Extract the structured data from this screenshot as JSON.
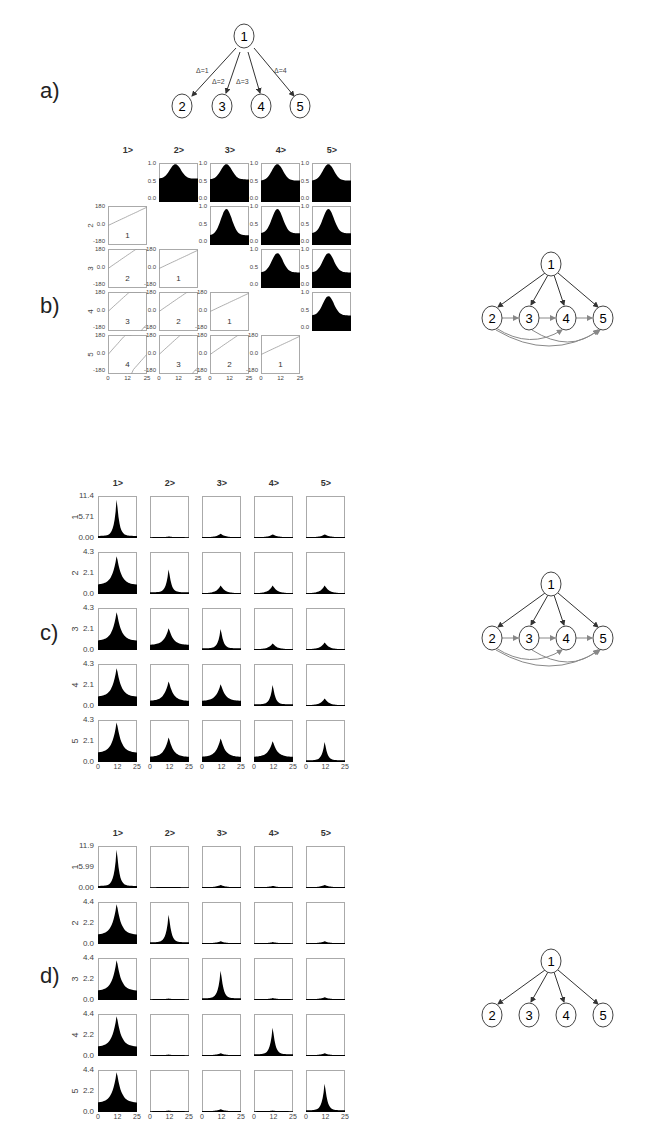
{
  "panels": {
    "a": {
      "letter": "a)"
    },
    "b": {
      "letter": "b)"
    },
    "c": {
      "letter": "c)"
    },
    "d": {
      "letter": "d)"
    }
  },
  "graph_a": {
    "nodes": [
      "1",
      "2",
      "3",
      "4",
      "5"
    ],
    "edge_labels": [
      "Δ=1",
      "Δ=2",
      "Δ=3",
      "Δ=4"
    ]
  },
  "graph_b": {
    "nodes": [
      "1",
      "2",
      "3",
      "4",
      "5"
    ]
  },
  "graph_c": {
    "nodes": [
      "1",
      "2",
      "3",
      "4",
      "5"
    ]
  },
  "graph_d": {
    "nodes": [
      "1",
      "2",
      "3",
      "4",
      "5"
    ]
  },
  "grid_columns": [
    "1>",
    "2>",
    "3>",
    "4>",
    "5>"
  ],
  "grid_rows": [
    "1",
    "2",
    "3",
    "4",
    "5"
  ],
  "x_ticks": [
    "0",
    "12",
    "25"
  ],
  "panel_b": {
    "upper_yticks": [
      "1.0",
      "0.5",
      "0.0"
    ],
    "lower_yticks": [
      "180",
      "0.0",
      "-180"
    ],
    "lower_labels": {
      "2-1": "1",
      "3-1": "2",
      "3-2": "1",
      "4-1": "3",
      "4-2": "2",
      "4-3": "1",
      "5-1": "4",
      "5-2": "3",
      "5-3": "2",
      "5-4": "1"
    }
  },
  "panel_c": {
    "yticks_row1": [
      "11.4",
      "5.71",
      "0.00"
    ],
    "yticks_other": [
      "4.3",
      "2.1",
      "0.0"
    ]
  },
  "panel_d": {
    "yticks_row1": [
      "11.9",
      "5.99",
      "0.00"
    ],
    "yticks_other": [
      "4.4",
      "2.2",
      "0.0"
    ]
  },
  "chart_data": [
    {
      "type": "area",
      "title": "b) coherence (upper) / phase (lower) matrix",
      "columns": [
        "1>",
        "2>",
        "3>",
        "4>",
        "5>"
      ],
      "rows": [
        "1",
        "2",
        "3",
        "4",
        "5"
      ],
      "xlabel": "",
      "x_ticks": [
        0,
        12,
        25
      ],
      "upper_ylim": [
        0,
        1
      ],
      "lower_ylim": [
        -180,
        180
      ],
      "upper_peak_heights": {
        "1-2": 1.0,
        "1-3": 1.0,
        "1-4": 1.0,
        "1-5": 1.0,
        "2-3": 0.95,
        "2-4": 0.95,
        "2-5": 0.95,
        "3-4": 0.92,
        "3-5": 0.92,
        "4-5": 0.92
      },
      "upper_baselines": {
        "1-2": 0.6,
        "1-3": 0.58,
        "1-4": 0.55,
        "1-5": 0.55,
        "2-3": 0.25,
        "2-4": 0.3,
        "2-5": 0.3,
        "3-4": 0.4,
        "3-5": 0.4,
        "4-5": 0.4
      },
      "lower_delay_labels": {
        "2-1": 1,
        "3-1": 2,
        "3-2": 1,
        "4-1": 3,
        "4-2": 2,
        "4-3": 1,
        "5-1": 4,
        "5-2": 3,
        "5-3": 2,
        "5-4": 1
      }
    },
    {
      "type": "area",
      "title": "c) spectral matrix",
      "columns": [
        "1>",
        "2>",
        "3>",
        "4>",
        "5>"
      ],
      "rows": [
        "1",
        "2",
        "3",
        "4",
        "5"
      ],
      "x_ticks": [
        0,
        12,
        25
      ],
      "ylim_row1": [
        0,
        11.4
      ],
      "ylim_other": [
        0,
        4.3
      ],
      "peaks": [
        [
          11.4,
          0.4,
          1.2,
          1.0,
          1.0
        ],
        [
          4.0,
          2.7,
          0.9,
          0.9,
          0.9
        ],
        [
          4.0,
          2.3,
          2.3,
          0.7,
          0.8
        ],
        [
          4.0,
          2.6,
          2.3,
          2.3,
          0.8
        ],
        [
          4.2,
          2.6,
          2.5,
          2.2,
          2.2
        ]
      ]
    },
    {
      "type": "area",
      "title": "d) spectral matrix",
      "columns": [
        "1>",
        "2>",
        "3>",
        "4>",
        "5>"
      ],
      "rows": [
        "1",
        "2",
        "3",
        "4",
        "5"
      ],
      "x_ticks": [
        0,
        12,
        25
      ],
      "ylim_row1": [
        0,
        11.9
      ],
      "ylim_other": [
        0,
        4.4
      ],
      "peaks": [
        [
          11.9,
          0.3,
          0.9,
          0.6,
          0.9
        ],
        [
          4.4,
          3.3,
          0.3,
          0.2,
          0.3
        ],
        [
          4.4,
          0.15,
          3.3,
          0.2,
          0.3
        ],
        [
          4.4,
          0.15,
          0.3,
          3.2,
          0.3
        ],
        [
          4.4,
          0.15,
          0.3,
          0.15,
          3.2
        ]
      ]
    }
  ]
}
